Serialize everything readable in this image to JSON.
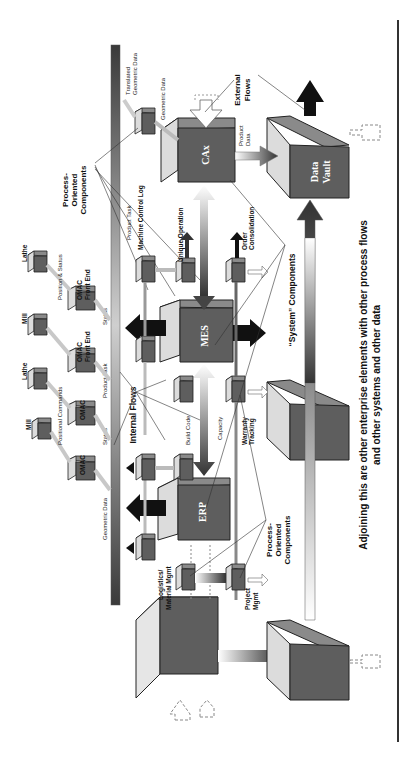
{
  "diagram": {
    "orientation": "rotated-90-ccw",
    "caption_line1": "Adjoining this are other enterprise elements with other process flows",
    "caption_line2": "and other systems and other data",
    "systems": {
      "cax": "CAx",
      "data_vault_1": "Data",
      "data_vault_2": "Vault",
      "mes": "MES",
      "erp": "ERP"
    },
    "callouts": {
      "process_oriented_top_1": "Process-",
      "process_oriented_top_2": "Oriented",
      "process_oriented_top_3": "Components",
      "process_oriented_bottom_1": "Process-",
      "process_oriented_bottom_2": "Oriented",
      "process_oriented_bottom_3": "Components",
      "system_components": "“System” Components",
      "internal_flows": "Internal Flows",
      "external_flows_1": "External",
      "external_flows_2": "Flows"
    },
    "process_labels": {
      "translated_geometric_1": "Translated",
      "translated_geometric_2": "Geometric Data",
      "geometric_data_cax": "Geometric Data",
      "product_data": "Product",
      "product_data_2": "Data",
      "product_task_top": "Product Task",
      "machine_control_log": "Machine Control Log",
      "unique_operation": "Unique Operation",
      "order_consolidation_1": "Order",
      "order_consolidation_2": "Consolidation",
      "status_1": "Status",
      "product_task_mid": "Product Task",
      "status_2": "Status",
      "build_code": "Build Code",
      "capacity": "Capacity",
      "warranty_1": "Warranty",
      "warranty_2": "Tracking",
      "geometric_data_left": "Geometric Data",
      "logistics_1": "Logistics/",
      "logistics_2": "Material Mgmt",
      "project_1": "Project",
      "project_2": "Mgmt"
    },
    "machines": {
      "lathe_1": "Lathe",
      "omac_fe_1a": "OMAC",
      "omac_fe_1b": "Front End",
      "position_status": "Position & Status",
      "mill_1": "Mill",
      "omac_fe_2a": "OMAC",
      "omac_fe_2b": "Front End",
      "lathe_2": "Lathe",
      "omac_3": "OMAC",
      "positional_commands": "Positional Commands",
      "mill_2": "Mill",
      "omac_4": "OMAC"
    },
    "colors": {
      "box_front": "#5f5f5f",
      "box_top": "#8c8c8c",
      "box_side": "#d4d4d4",
      "arrow_dark": "#111111",
      "rule": "#333333"
    }
  }
}
